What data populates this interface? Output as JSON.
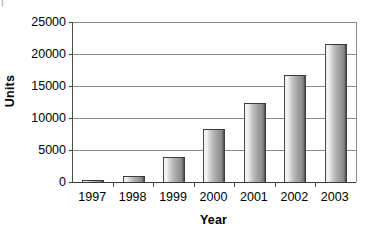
{
  "scan": {
    "top_left_fragment": "|"
  },
  "chart_data": {
    "type": "bar",
    "title": "",
    "xlabel": "Year",
    "ylabel": "Units",
    "categories": [
      "1997",
      "1998",
      "1999",
      "2000",
      "2001",
      "2002",
      "2003"
    ],
    "values": [
      200,
      1000,
      3900,
      8300,
      12400,
      16700,
      21600
    ],
    "series": [
      {
        "name": "Units",
        "values": [
          200,
          1000,
          3900,
          8300,
          12400,
          16700,
          21600
        ]
      }
    ],
    "ylim": [
      0,
      25000
    ],
    "yticks": [
      0,
      5000,
      10000,
      15000,
      20000,
      25000
    ],
    "ytick_labels": [
      "0",
      "5000",
      "10000",
      "15000",
      "20000",
      "25000"
    ],
    "grid": true,
    "grid_axis": "y",
    "legend": false,
    "legend_position": "none",
    "bar_color": "#a8a8a8",
    "bar_edge_color": "#3a3a3a",
    "grid_color": "#8a8a8a",
    "axis_color": "#4d4d4d",
    "text_color": "#000000",
    "background": "#ffffff"
  }
}
